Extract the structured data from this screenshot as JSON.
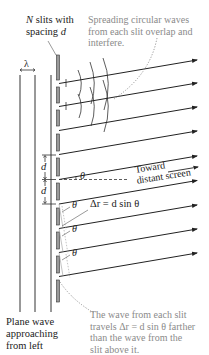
{
  "labels": {
    "slits_title_line1_var": "N",
    "slits_title_line1_rest": " slits with",
    "slits_title_line2_rest": "spacing ",
    "slits_title_line2_var": "d",
    "spreading_line1": "Spreading circular waves",
    "spreading_line2": "from each slit overlap and",
    "spreading_line3": "interfere.",
    "lambda": "λ",
    "d_upper": "d",
    "d_lower": "d",
    "theta_center": "θ",
    "toward_line1": "Toward",
    "toward_line2": "distant screen",
    "theta_1": "θ",
    "theta_2": "θ",
    "theta_3": "θ",
    "delta_r": "Δr = d sin θ",
    "plane_wave_line1": "Plane wave",
    "plane_wave_line2": "approaching",
    "plane_wave_line3": "from left",
    "path_diff_line1": "The wave from each slit",
    "path_diff_line2": "travels Δr = d sin θ farther",
    "path_diff_line3": "than the wave from the",
    "path_diff_line4": "slit above it."
  },
  "colors": {
    "ink": "#222222",
    "annotation_gray": "#8a8a8a",
    "slit_fill": "#9a9a9a"
  },
  "diagram": {
    "slit_count": 9,
    "plane_wave_lines": 3
  }
}
